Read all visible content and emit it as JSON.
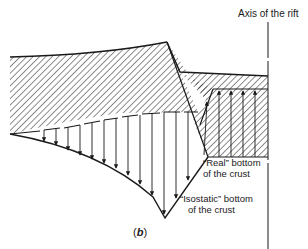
{
  "figure": {
    "panel_label_open": "(",
    "panel_letter": "b",
    "panel_label_close": ")",
    "axis_label": "Axis of the rift",
    "real_bottom_label_line1": "“Real” bottom",
    "real_bottom_label_line2": "of the crust",
    "isostatic_bottom_label_line1": "“Isostatic” bottom",
    "isostatic_bottom_label_line2": "of the crust",
    "colors": {
      "ink": "#1a1a1a",
      "background": "#ffffff"
    }
  }
}
